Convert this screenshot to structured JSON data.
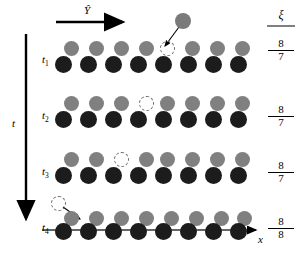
{
  "figure": {
    "type": "lattice-diffusion-timeline",
    "colors": {
      "substrate_atom": "#1c1c1c",
      "adatom": "#808080",
      "vacancy_outline": "#6a6a6a",
      "arrow": "#000000",
      "background": "#ffffff"
    }
  },
  "axes": {
    "top_arrow_label": "Ŷ",
    "vertical_axis_label": "t",
    "horizontal_axis_label": "x"
  },
  "ratio_header": {
    "symbol": "ξ"
  },
  "time_steps": [
    {
      "label": "t",
      "sub": "1",
      "ratio_numerator": "8",
      "ratio_denominator": "7",
      "adatom_count": 7,
      "substrate_count": 8,
      "vacancy_index": 4,
      "mobile_atom": "above-right",
      "hop_direction": "down-left"
    },
    {
      "label": "t",
      "sub": "2",
      "ratio_numerator": "8",
      "ratio_denominator": "7",
      "adatom_count": 7,
      "substrate_count": 8,
      "vacancy_index": 3,
      "mobile_atom": "none",
      "hop_direction": "none"
    },
    {
      "label": "t",
      "sub": "3",
      "ratio_numerator": "8",
      "ratio_denominator": "7",
      "adatom_count": 7,
      "substrate_count": 8,
      "vacancy_index": 2,
      "mobile_atom": "none",
      "hop_direction": "none"
    },
    {
      "label": "t",
      "sub": "4",
      "ratio_numerator": "8",
      "ratio_denominator": "8",
      "adatom_count": 8,
      "substrate_count": 8,
      "vacancy_index": -1,
      "mobile_atom": "above-left",
      "hop_direction": "down-right"
    }
  ]
}
